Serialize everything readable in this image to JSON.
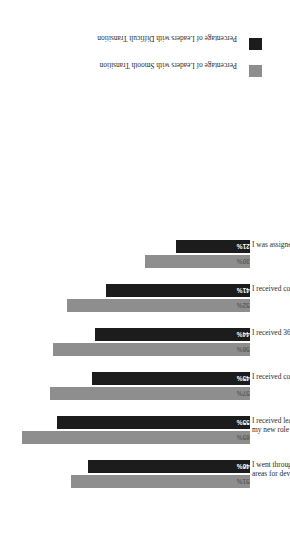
{
  "chart_data": {
    "type": "bar",
    "title": "",
    "subtitle": "",
    "xlabel": "",
    "ylabel": "",
    "orientation": "vertical-grouped-rotated",
    "grid": false,
    "ylim": [
      0,
      70
    ],
    "legend_position": "right",
    "categories": [
      "I went through a formal assessment to identify my leadership strengths and areas for development",
      "I received leadership/interpersonal training to develop the skills needed for my new role",
      "I received coaching for my leadership transition from my current manager",
      "I received 360-degree feedback about my skills",
      "I received coaching for the transition from my previous manager",
      "I was assigned a formal mentor or coach to help with the transition"
    ],
    "series": [
      {
        "name": "Percentage of Leaders with Smooth Transition",
        "color": "#8e8e8e",
        "values": [
          51,
          65,
          57,
          56,
          52,
          30
        ],
        "labels": [
          "51%",
          "65%",
          "57%",
          "56%",
          "52%",
          "30%"
        ]
      },
      {
        "name": "Percentage of Leaders with Difficult Transition",
        "color": "#1c1c1c",
        "values": [
          46,
          55,
          45,
          44,
          41,
          21
        ],
        "labels": [
          "46%",
          "55%",
          "45%",
          "44%",
          "41%",
          "21%"
        ]
      }
    ]
  }
}
